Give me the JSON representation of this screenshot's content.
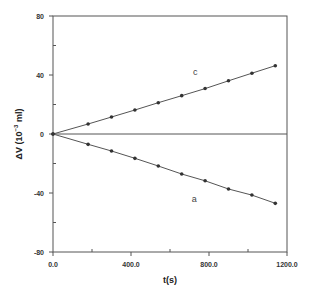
{
  "chart_data": {
    "type": "line",
    "title": "",
    "xlabel": "t(s)",
    "ylabel": "ΔV (10^-3 ml)",
    "ylabel_parts": {
      "main": "ΔV (10",
      "sup": "−3",
      "tail": " ml)"
    },
    "xlim": [
      0,
      1200
    ],
    "ylim": [
      -80,
      80
    ],
    "x_ticks": [
      0,
      400,
      800,
      1200
    ],
    "x_tick_labels": [
      "0.0",
      "400.0",
      "800.0",
      "1200.0"
    ],
    "x_minor_ticks": [
      200,
      600,
      1000
    ],
    "y_ticks": [
      -80,
      -40,
      0,
      40,
      80
    ],
    "y_tick_labels": [
      "-80",
      "-40",
      "0",
      "40",
      "80"
    ],
    "y_minor_ticks": [
      -60,
      -20,
      20,
      60
    ],
    "grid": false,
    "zero_line": true,
    "legend": "none",
    "x": [
      0,
      180,
      300,
      420,
      540,
      660,
      780,
      900,
      1020,
      1140
    ],
    "series": [
      {
        "name": "c",
        "values": [
          0,
          6.8,
          11.5,
          16.3,
          21.2,
          26.0,
          30.8,
          36.1,
          41.2,
          46.3
        ],
        "label_pos": [
          730,
          40
        ]
      },
      {
        "name": "a",
        "values": [
          0,
          -7.0,
          -11.5,
          -16.5,
          -21.7,
          -27.1,
          -31.7,
          -37.3,
          -41.4,
          -47.0
        ],
        "label_pos": [
          725,
          -46
        ]
      }
    ],
    "colors": {
      "line": "#555555",
      "marker": "#333333",
      "frame": "#555555"
    }
  }
}
